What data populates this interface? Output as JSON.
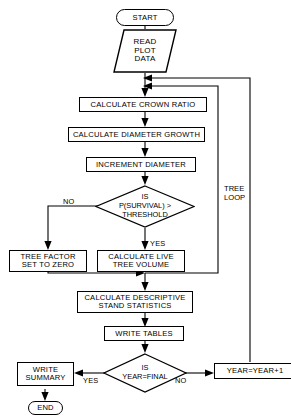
{
  "diagram": {
    "type": "flowchart",
    "nodes": {
      "start": "START",
      "read_plot_data": "READ\nPLOT\nDATA",
      "crown_ratio": "CALCULATE CROWN RATIO",
      "diameter_growth": "CALCULATE DIAMETER GROWTH",
      "increment_diameter": "INCREMENT DIAMETER",
      "survival_line1": "IS",
      "survival_line2": "P(SURVIVAL) >",
      "survival_line3": "THRESHOLD",
      "tree_factor_line1": "TREE FACTOR",
      "tree_factor_line2": "SET TO ZERO",
      "live_volume_line1": "CALCULATE LIVE",
      "live_volume_line2": "TREE VOLUME",
      "stand_stats_line1": "CALCULATE DESCRIPTIVE",
      "stand_stats_line2": "STAND STATISTICS",
      "write_tables": "WRITE TABLES",
      "year_final_line1": "IS",
      "year_final_line2": "YEAR=FINAL",
      "write_summary_line1": "WRITE",
      "write_summary_line2": "SUMMARY",
      "end": "END",
      "year_increment": "YEAR=YEAR+1"
    },
    "edge_labels": {
      "survival_no": "NO",
      "survival_yes": "YES",
      "year_yes": "YES",
      "year_no": "NO"
    },
    "annotations": {
      "tree_loop_line1": "TREE",
      "tree_loop_line2": "LOOP"
    },
    "colors": {
      "stroke": "#000000",
      "background": "#ffffff"
    }
  }
}
